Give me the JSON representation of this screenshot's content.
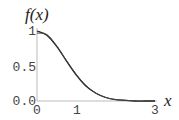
{
  "chart_data": {
    "type": "line",
    "title": "",
    "xlabel": "x",
    "ylabel": "f(x)",
    "xlim": [
      0,
      3
    ],
    "ylim": [
      0,
      1
    ],
    "x_ticks": [
      "0",
      "1",
      "3"
    ],
    "y_ticks": [
      "0.0",
      "0.5",
      "1"
    ],
    "grid": false,
    "legend": null,
    "series": [
      {
        "name": "curve-a",
        "x": [
          0,
          0.25,
          0.5,
          0.75,
          1.0,
          1.25,
          1.5,
          1.75,
          2.0,
          2.25,
          2.5,
          2.75,
          3.0
        ],
        "values": [
          1.0,
          0.94,
          0.78,
          0.57,
          0.37,
          0.21,
          0.11,
          0.05,
          0.02,
          0.01,
          0.0,
          0.0,
          0.0
        ]
      },
      {
        "name": "curve-b",
        "x": [
          0,
          0.25,
          0.5,
          0.75,
          1.0,
          1.25,
          1.5,
          1.75,
          2.0,
          2.25,
          2.5,
          2.75,
          3.0
        ],
        "values": [
          0.97,
          0.95,
          0.79,
          0.58,
          0.38,
          0.22,
          0.11,
          0.05,
          0.02,
          0.01,
          0.0,
          0.0,
          0.0
        ]
      }
    ],
    "colors": {
      "curve": "#222222",
      "axis": "#bbbbbb"
    }
  },
  "labels": {
    "ylabel": "f(x)",
    "xlabel": "x",
    "y_tick_1": "1",
    "y_tick_05": "0.5",
    "y_tick_0": "0.0",
    "x_tick_0": "0",
    "x_tick_1": "1",
    "x_tick_3": "3"
  }
}
